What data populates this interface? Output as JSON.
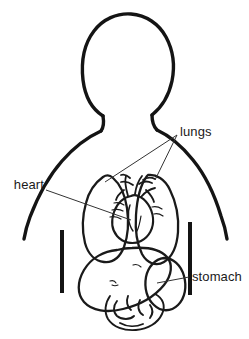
{
  "figure": {
    "background_color": "#ffffff",
    "ink_color": "#141414",
    "organ_outline_color": "#1a1a1a",
    "leader_line_color": "#333333",
    "width": 249,
    "height": 339
  },
  "labels": {
    "lungs": "lungs",
    "heart": "heart",
    "stomach": "stomach"
  },
  "parts": {
    "head": "head-outline",
    "neck": "neck-outline",
    "left_shoulder": "left-shoulder-outline",
    "right_shoulder": "right-shoulder-outline",
    "left_arm_bar": "left-arm-bar",
    "right_arm_bar": "right-arm-bar",
    "left_lung": "left-lung",
    "right_lung": "right-lung",
    "heart_organ": "heart-organ",
    "stomach_organ": "stomach-organ",
    "intestines": "intestines"
  }
}
